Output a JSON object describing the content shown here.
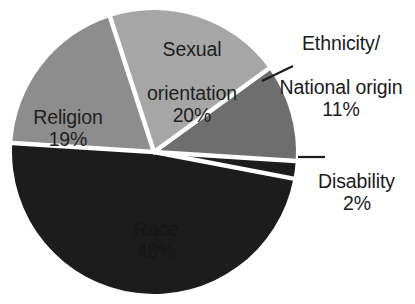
{
  "chart_data": {
    "type": "pie",
    "title": "",
    "subtitle": "",
    "xlabel": "",
    "ylabel": "",
    "legend_position": "none",
    "labels_position": "callout-and-inside",
    "grid": false,
    "units": "%",
    "total": 100,
    "categories": [
      "Sexual orientation",
      "Ethnicity/National origin",
      "Disability",
      "Race",
      "Religion"
    ],
    "values": [
      20,
      11,
      2,
      48,
      19
    ],
    "slices": [
      {
        "name": "sexual-orientation",
        "label": "Sexual\norientation",
        "label_line1": "Sexual",
        "label_line2": "orientation",
        "value": 20,
        "value_text": "20%",
        "color": "#a6a6a6",
        "start_angle": -18,
        "end_angle": 54,
        "label_placement": "inside"
      },
      {
        "name": "ethnicity-national-origin",
        "label": "Ethnicity/\nNational origin",
        "label_line1": "Ethnicity/",
        "label_line2": "National origin",
        "value": 11,
        "value_text": "11%",
        "color": "#6e6e6e",
        "start_angle": 54,
        "end_angle": 93.6,
        "label_placement": "callout",
        "has_leader_line": true
      },
      {
        "name": "disability",
        "label": "Disability",
        "label_line1": "Disability",
        "label_line2": "",
        "value": 2,
        "value_text": "2%",
        "color": "#1c1c1c",
        "start_angle": 93.6,
        "end_angle": 100.8,
        "label_placement": "callout",
        "has_leader_line": true
      },
      {
        "name": "race",
        "label": "Race",
        "label_line1": "Race",
        "label_line2": "",
        "value": 48,
        "value_text": "48%",
        "color": "#1c1c1c",
        "start_angle": 100.8,
        "end_angle": 273.6,
        "label_placement": "inside"
      },
      {
        "name": "religion",
        "label": "Religion",
        "label_line1": "Religion",
        "label_line2": "",
        "value": 19,
        "value_text": "19%",
        "color": "#8d8d8d",
        "start_angle": 273.6,
        "end_angle": 342,
        "label_placement": "inside"
      }
    ],
    "colors": {
      "sexual_orientation": "#a6a6a6",
      "ethnicity": "#6e6e6e",
      "disability": "#1c1c1c",
      "race": "#1c1c1c",
      "religion": "#8d8d8d",
      "separator": "#ffffff",
      "background": "#ffffff",
      "label_text": "#1b1b1b"
    },
    "geometry": {
      "center_x": 154,
      "center_y": 152,
      "radius": 142
    }
  }
}
